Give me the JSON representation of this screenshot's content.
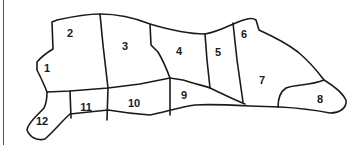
{
  "diagram": {
    "type": "cut-chart",
    "stroke_color": "#1a1a1a",
    "background": "#ffffff",
    "regions": [
      {
        "id": "1",
        "label": "1",
        "x": 47,
        "y": 68
      },
      {
        "id": "2",
        "label": "2",
        "x": 70,
        "y": 34
      },
      {
        "id": "3",
        "label": "3",
        "x": 125,
        "y": 49
      },
      {
        "id": "4",
        "label": "4",
        "x": 178,
        "y": 52
      },
      {
        "id": "5",
        "label": "5",
        "x": 218,
        "y": 55
      },
      {
        "id": "6",
        "label": "6",
        "x": 243,
        "y": 37
      },
      {
        "id": "7",
        "label": "7",
        "x": 262,
        "y": 83
      },
      {
        "id": "8",
        "label": "8",
        "x": 320,
        "y": 101
      },
      {
        "id": "9",
        "label": "9",
        "x": 183,
        "y": 97
      },
      {
        "id": "10",
        "label": "10",
        "x": 132,
        "y": 106
      },
      {
        "id": "11",
        "label": "11",
        "x": 85,
        "y": 108
      },
      {
        "id": "12",
        "label": "12",
        "x": 40,
        "y": 125
      }
    ]
  }
}
